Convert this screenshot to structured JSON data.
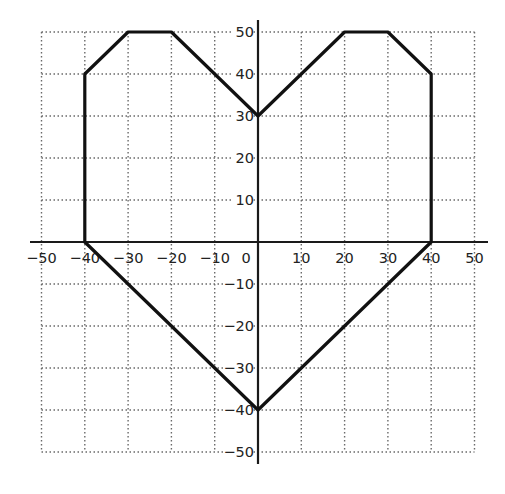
{
  "chart_data": {
    "type": "line",
    "title": "",
    "xlabel": "",
    "ylabel": "",
    "xlim": [
      -50,
      50
    ],
    "ylim": [
      -50,
      50
    ],
    "grid": true,
    "grid_style": "dotted",
    "x_ticks": [
      -50,
      -40,
      -30,
      -20,
      -10,
      0,
      10,
      20,
      30,
      40,
      50
    ],
    "y_ticks": [
      50,
      40,
      30,
      20,
      10,
      -10,
      -20,
      -30,
      -40,
      -50
    ],
    "x_tick_labels": [
      "−50",
      "−40",
      "−30",
      "−20",
      "−10",
      "0",
      "10",
      "20",
      "30",
      "40",
      "50"
    ],
    "y_tick_labels": [
      "50",
      "40",
      "30",
      "20",
      "10",
      "−10",
      "−20",
      "−30",
      "−40",
      "−50"
    ],
    "series": [
      {
        "name": "heart outline",
        "closed": true,
        "points": [
          [
            0,
            30
          ],
          [
            -20,
            50
          ],
          [
            -30,
            50
          ],
          [
            -40,
            40
          ],
          [
            -40,
            0
          ],
          [
            0,
            -40
          ],
          [
            40,
            0
          ],
          [
            40,
            40
          ],
          [
            30,
            50
          ],
          [
            20,
            50
          ],
          [
            10,
            40
          ],
          [
            0,
            30
          ]
        ]
      }
    ],
    "legend": null
  },
  "colors": {
    "background": "#ffffff",
    "line": "#111111",
    "grid": "#6a6a6a",
    "axis": "#1a1a1a"
  }
}
